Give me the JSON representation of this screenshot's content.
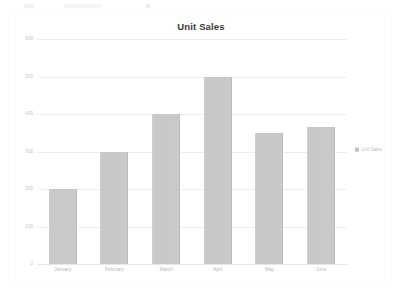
{
  "document": {
    "strip_visible": true
  },
  "chart": {
    "title": "Unit Sales",
    "legend": {
      "position": "right",
      "entries": [
        {
          "label": "Unit Sales",
          "color": "#c3c3c3"
        }
      ]
    }
  },
  "chart_data": {
    "type": "bar",
    "title": "Unit Sales",
    "xlabel": "",
    "ylabel": "",
    "categories": [
      "January",
      "February",
      "March",
      "April",
      "May",
      "June"
    ],
    "values": [
      200,
      300,
      400,
      500,
      350,
      365
    ],
    "series": [
      {
        "name": "Unit Sales",
        "values": [
          200,
          300,
          400,
          500,
          350,
          365
        ],
        "color": "#c3c3c3"
      }
    ],
    "ylim": [
      0,
      600
    ],
    "yticks": [
      0,
      100,
      200,
      300,
      400,
      500,
      600
    ],
    "ytick_labels": [
      "0",
      "100",
      "200",
      "300",
      "400",
      "500",
      "600"
    ],
    "grid": true,
    "grid_color": "#e8eef4",
    "legend_position": "right",
    "background": "#ffffff"
  }
}
